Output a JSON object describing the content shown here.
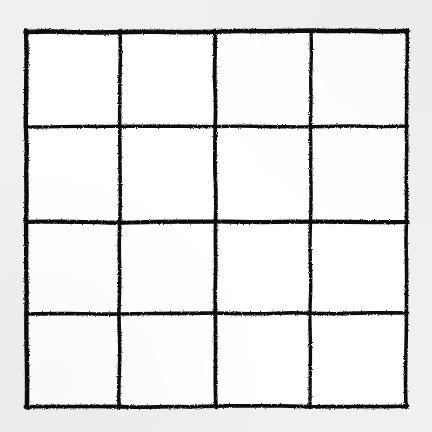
{
  "figure": {
    "canvas": {
      "width": 432,
      "height": 432,
      "background_color": "#f0f0f1",
      "cell_fill_color": "#ffffff",
      "ink_color": "#101010"
    },
    "grid": {
      "rows": 4,
      "columns": 4,
      "cell_count": 16,
      "line_style": "hand-drawn",
      "stroke_width_min": 3,
      "stroke_width_max": 5,
      "vertical_line_x": [
        26,
        120,
        215,
        311,
        407
      ],
      "horizontal_line_y": [
        31,
        127,
        222,
        314,
        407
      ],
      "bounds": {
        "left": 26,
        "top": 31,
        "right": 407,
        "bottom": 407
      }
    },
    "vertical_lines": [
      {
        "name": "v-line-0",
        "x_top": 26,
        "x_bottom": 27,
        "y_start": 31,
        "y_end": 407,
        "width": 4.4
      },
      {
        "name": "v-line-1",
        "x_top": 120,
        "x_bottom": 119,
        "y_start": 31,
        "y_end": 407,
        "width": 3.6
      },
      {
        "name": "v-line-2",
        "x_top": 215,
        "x_bottom": 216,
        "y_start": 31,
        "y_end": 407,
        "width": 3.8
      },
      {
        "name": "v-line-3",
        "x_top": 311,
        "x_bottom": 310,
        "y_start": 31,
        "y_end": 407,
        "width": 3.4
      },
      {
        "name": "v-line-4",
        "x_top": 407,
        "x_bottom": 406,
        "y_start": 31,
        "y_end": 407,
        "width": 3.6
      }
    ],
    "horizontal_lines": [
      {
        "name": "h-line-0",
        "y_left": 32,
        "y_right": 31,
        "x_start": 26,
        "x_end": 407,
        "width": 4.6
      },
      {
        "name": "h-line-1",
        "y_left": 127,
        "y_right": 126,
        "x_start": 26,
        "x_end": 407,
        "width": 3.4
      },
      {
        "name": "h-line-2",
        "y_left": 222,
        "y_right": 222,
        "x_start": 26,
        "x_end": 407,
        "width": 4.2
      },
      {
        "name": "h-line-3",
        "y_left": 314,
        "y_right": 313,
        "x_start": 26,
        "x_end": 407,
        "width": 3.6
      },
      {
        "name": "h-line-4",
        "y_left": 407,
        "y_right": 406,
        "x_start": 26,
        "x_end": 407,
        "width": 3.8
      }
    ]
  }
}
